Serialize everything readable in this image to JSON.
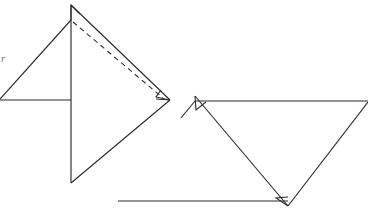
{
  "figure": {
    "canvas": {
      "width": 368,
      "height": 223,
      "background": "#ffffff"
    },
    "style": {
      "solid_stroke_color": "#2b2b2b",
      "dashed_stroke_color": "#2f2f2f",
      "label_color": "#6e6e6e",
      "stroke_width": 1.15,
      "dash_pattern": "5 4"
    },
    "labels": {
      "left_edge_label": "r"
    },
    "left_shape": {
      "name": "left-triangle-group",
      "vertices": {
        "apex_top": {
          "x": 71,
          "y": 5
        },
        "arrow_notch": {
          "x": 71,
          "y": 20
        },
        "left_mid": {
          "x": 0,
          "y": 100
        },
        "right_vertex": {
          "x": 170,
          "y": 100
        },
        "bottom_vertex": {
          "x": 71,
          "y": 183
        }
      },
      "segments": [
        {
          "name": "apex-to-left-mid",
          "from": "apex_top",
          "to": "left_mid",
          "style": "solid"
        },
        {
          "name": "apex-to-right-vertex",
          "from": "apex_top",
          "to": "right_vertex",
          "style": "solid"
        },
        {
          "name": "apex-to-bottom-vertex",
          "from": "apex_top",
          "to": "bottom_vertex",
          "style": "solid"
        },
        {
          "name": "left-mid-horizontal",
          "from": "left_mid",
          "to": "apex_vertical",
          "style": "solid"
        },
        {
          "name": "bottom-vertex-to-right-vertex",
          "from": "bottom_vertex",
          "to": "right_vertex",
          "style": "solid"
        },
        {
          "name": "apex-to-right-vertex-hidden",
          "from": "arrow_notch",
          "to": "right_vertex",
          "style": "dashed"
        }
      ],
      "arrow_heads": [
        {
          "name": "apex-arrowhead",
          "at": {
            "x": 71,
            "y": 5
          }
        },
        {
          "name": "right-vertex-arrowhead",
          "at": {
            "x": 170,
            "y": 100
          }
        }
      ]
    },
    "right_shape": {
      "name": "right-triangle-group",
      "vertices": {
        "left_vertex": {
          "x": 195,
          "y": 96
        },
        "far_right_vertex": {
          "x": 368,
          "y": 102
        },
        "bottom_vertex": {
          "x": 288,
          "y": 206
        },
        "bottom_left_end": {
          "x": 118,
          "y": 201
        }
      },
      "segments": [
        {
          "name": "top-horizontal",
          "from": "left_vertex",
          "to": "far_right_vertex",
          "style": "solid"
        },
        {
          "name": "left-to-bottom-vertex",
          "from": "left_vertex",
          "to": "bottom_vertex",
          "style": "solid"
        },
        {
          "name": "far-right-to-bottom-vertex",
          "from": "far_right_vertex",
          "to": "bottom_vertex",
          "style": "solid"
        },
        {
          "name": "bottom-horizontal",
          "from": "bottom_left_end",
          "to": "bottom_vertex",
          "style": "solid"
        },
        {
          "name": "left-vertex-tail",
          "from": "left_vertex",
          "to": "lower_left_tail",
          "style": "solid"
        }
      ],
      "arrow_heads": [
        {
          "name": "left-vertex-arrowhead",
          "at": {
            "x": 195,
            "y": 96
          }
        },
        {
          "name": "bottom-vertex-arrowhead",
          "at": {
            "x": 288,
            "y": 206
          }
        }
      ]
    }
  }
}
